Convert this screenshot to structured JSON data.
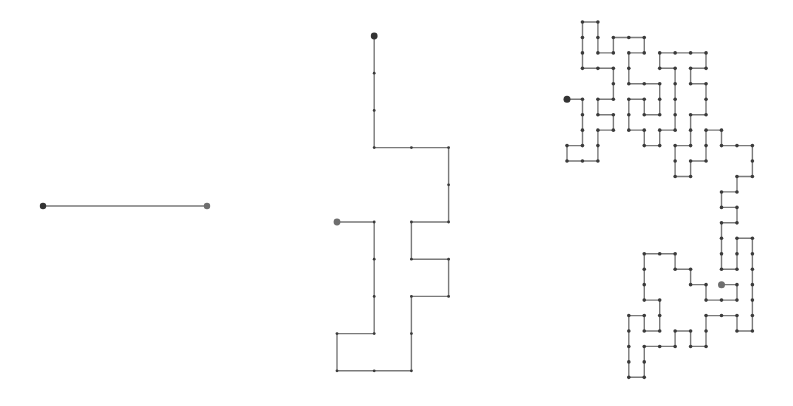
{
  "figure": {
    "colors": {
      "line": "#7a7a7a",
      "vertex": "#3a3a3a",
      "start": "#333333",
      "end": "#6e6e6e",
      "background": "#ffffff"
    }
  },
  "walks": [
    {
      "id": "walk-1",
      "origin": [
        43,
        206
      ],
      "step": 164,
      "vertex_radius": 0,
      "start_radius": 3.2,
      "end_radius": 3.2,
      "points": [
        [
          0,
          0
        ],
        [
          1,
          0
        ]
      ]
    },
    {
      "id": "walk-2",
      "origin": [
        337,
        36
      ],
      "step": 37.2,
      "vertex_radius": 1.4,
      "start_radius": 3.4,
      "end_radius": 3.4,
      "points": [
        [
          1,
          0
        ],
        [
          1,
          1
        ],
        [
          1,
          2
        ],
        [
          1,
          3
        ],
        [
          2,
          3
        ],
        [
          3,
          3
        ],
        [
          3,
          4
        ],
        [
          3,
          5
        ],
        [
          2,
          5
        ],
        [
          2,
          6
        ],
        [
          3,
          6
        ],
        [
          3,
          7
        ],
        [
          2,
          7
        ],
        [
          2,
          8
        ],
        [
          2,
          9
        ],
        [
          1,
          9
        ],
        [
          0,
          9
        ],
        [
          0,
          8
        ],
        [
          1,
          8
        ],
        [
          1,
          7
        ],
        [
          1,
          6
        ],
        [
          1,
          5
        ],
        [
          0,
          5
        ]
      ]
    },
    {
      "id": "walk-3",
      "origin": [
        567,
        22
      ],
      "step": 15.45,
      "vertex_radius": 1.8,
      "start_radius": 3.5,
      "end_radius": 3.5,
      "points": [
        [
          10,
          17
        ],
        [
          11,
          17
        ],
        [
          11,
          18
        ],
        [
          10,
          18
        ],
        [
          9,
          18
        ],
        [
          9,
          17
        ],
        [
          8,
          17
        ],
        [
          8,
          16
        ],
        [
          7,
          16
        ],
        [
          7,
          15
        ],
        [
          6,
          15
        ],
        [
          5,
          15
        ],
        [
          5,
          16
        ],
        [
          5,
          17
        ],
        [
          5,
          18
        ],
        [
          6,
          18
        ],
        [
          6,
          19
        ],
        [
          6,
          20
        ],
        [
          5,
          20
        ],
        [
          5,
          19
        ],
        [
          4,
          19
        ],
        [
          4,
          20
        ],
        [
          4,
          21
        ],
        [
          4,
          22
        ],
        [
          4,
          23
        ],
        [
          5,
          23
        ],
        [
          5,
          22
        ],
        [
          5,
          21
        ],
        [
          6,
          21
        ],
        [
          7,
          21
        ],
        [
          7,
          20
        ],
        [
          8,
          20
        ],
        [
          8,
          21
        ],
        [
          9,
          21
        ],
        [
          9,
          20
        ],
        [
          9,
          19
        ],
        [
          10,
          19
        ],
        [
          11,
          19
        ],
        [
          11,
          20
        ],
        [
          12,
          20
        ],
        [
          12,
          19
        ],
        [
          12,
          18
        ],
        [
          12,
          17
        ],
        [
          12,
          16
        ],
        [
          12,
          15
        ],
        [
          12,
          14
        ],
        [
          11,
          14
        ],
        [
          11,
          15
        ],
        [
          11,
          16
        ],
        [
          10,
          16
        ],
        [
          10,
          15
        ],
        [
          10,
          14
        ],
        [
          10,
          13
        ],
        [
          11,
          13
        ],
        [
          11,
          12
        ],
        [
          10,
          12
        ],
        [
          10,
          11
        ],
        [
          11,
          11
        ],
        [
          11,
          10
        ],
        [
          12,
          10
        ],
        [
          12,
          9
        ],
        [
          12,
          8
        ],
        [
          11,
          8
        ],
        [
          10,
          8
        ],
        [
          10,
          7
        ],
        [
          9,
          7
        ],
        [
          9,
          8
        ],
        [
          9,
          9
        ],
        [
          8,
          9
        ],
        [
          8,
          10
        ],
        [
          7,
          10
        ],
        [
          7,
          9
        ],
        [
          7,
          8
        ],
        [
          8,
          8
        ],
        [
          8,
          7
        ],
        [
          8,
          6
        ],
        [
          9,
          6
        ],
        [
          9,
          5
        ],
        [
          9,
          4
        ],
        [
          8,
          4
        ],
        [
          8,
          3
        ],
        [
          9,
          3
        ],
        [
          9,
          2
        ],
        [
          8,
          2
        ],
        [
          7,
          2
        ],
        [
          6,
          2
        ],
        [
          6,
          3
        ],
        [
          7,
          3
        ],
        [
          7,
          4
        ],
        [
          7,
          5
        ],
        [
          7,
          6
        ],
        [
          7,
          7
        ],
        [
          6,
          7
        ],
        [
          6,
          8
        ],
        [
          5,
          8
        ],
        [
          5,
          7
        ],
        [
          4,
          7
        ],
        [
          4,
          6
        ],
        [
          4,
          5
        ],
        [
          5,
          5
        ],
        [
          5,
          6
        ],
        [
          6,
          6
        ],
        [
          6,
          5
        ],
        [
          6,
          4
        ],
        [
          5,
          4
        ],
        [
          4,
          4
        ],
        [
          4,
          3
        ],
        [
          4,
          2
        ],
        [
          5,
          2
        ],
        [
          5,
          1
        ],
        [
          4,
          1
        ],
        [
          3,
          1
        ],
        [
          3,
          2
        ],
        [
          2,
          2
        ],
        [
          2,
          1
        ],
        [
          2,
          0
        ],
        [
          1,
          0
        ],
        [
          1,
          1
        ],
        [
          1,
          2
        ],
        [
          1,
          3
        ],
        [
          2,
          3
        ],
        [
          3,
          3
        ],
        [
          3,
          4
        ],
        [
          3,
          5
        ],
        [
          2,
          5
        ],
        [
          2,
          6
        ],
        [
          3,
          6
        ],
        [
          3,
          7
        ],
        [
          2,
          7
        ],
        [
          2,
          8
        ],
        [
          2,
          9
        ],
        [
          1,
          9
        ],
        [
          0,
          9
        ],
        [
          0,
          8
        ],
        [
          1,
          8
        ],
        [
          1,
          7
        ],
        [
          1,
          6
        ],
        [
          1,
          5
        ],
        [
          0,
          5
        ]
      ],
      "start_is_last": true
    }
  ]
}
